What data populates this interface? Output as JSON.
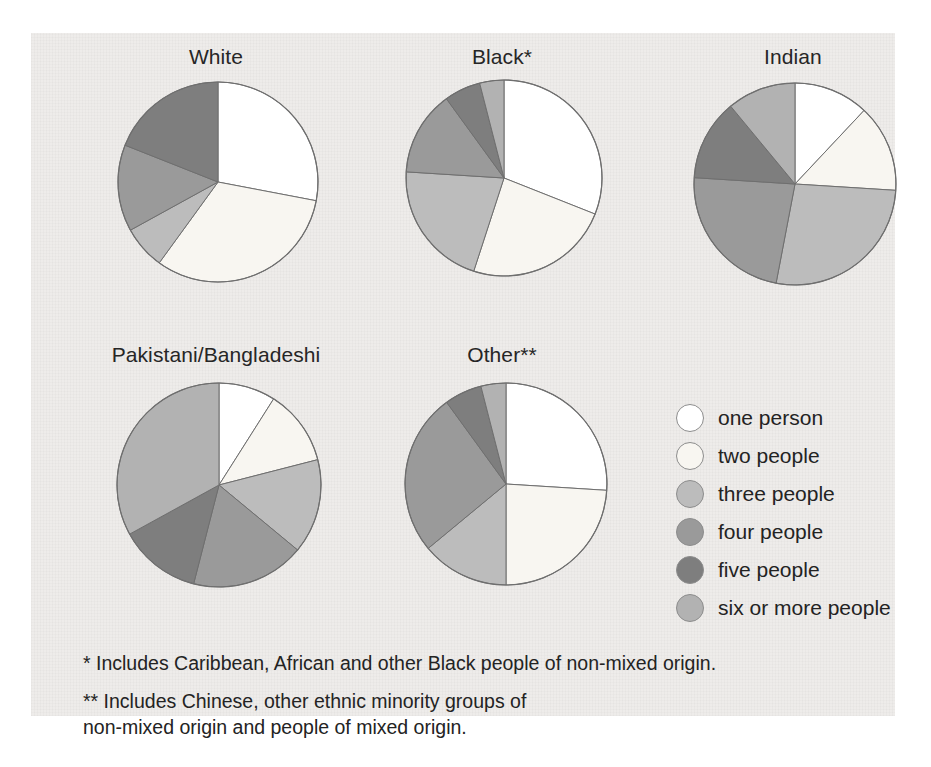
{
  "figure": {
    "background_color": "#ffffff",
    "panel_color": "#eeecea",
    "text_color": "#232323"
  },
  "legend": {
    "items": [
      {
        "label": "one person",
        "color": "#ffffff",
        "key": "one"
      },
      {
        "label": "two people",
        "color": "#f8f6f1",
        "key": "two"
      },
      {
        "label": "three people",
        "color": "#bcbcbc",
        "key": "three"
      },
      {
        "label": "four people",
        "color": "#9a9a9a",
        "key": "four"
      },
      {
        "label": "five people",
        "color": "#7e7e7e",
        "key": "five"
      },
      {
        "label": "six or more people",
        "color": "#b2b2b2",
        "key": "six_plus"
      }
    ]
  },
  "footnotes": [
    "* Includes Caribbean, African and other Black people of non-mixed origin.",
    "** Includes Chinese, other ethnic minority groups of\n     non-mixed origin and people of mixed origin."
  ],
  "chart_data": {
    "type": "pie",
    "title": "",
    "subtitle": "",
    "legend_position": "right-middle",
    "grid": false,
    "slice_labels": [
      "one person",
      "two people",
      "three people",
      "four people",
      "five people",
      "six or more people"
    ],
    "slice_colors": [
      "#ffffff",
      "#f8f6f1",
      "#bcbcbc",
      "#9a9a9a",
      "#7e7e7e",
      "#b2b2b2"
    ],
    "units": "percent of households",
    "charts": [
      {
        "name": "White",
        "title": "White",
        "center_x": 185,
        "center_y": 185,
        "radius": 100,
        "values": [
          28,
          32,
          7,
          14,
          19,
          0
        ],
        "start_angle_deg": 0
      },
      {
        "name": "Black",
        "title": "Black*",
        "center_x": 471,
        "center_y": 181,
        "radius": 98,
        "values": [
          31,
          24,
          21,
          14,
          6,
          4
        ],
        "start_angle_deg": 0
      },
      {
        "name": "Indian",
        "title": "Indian",
        "center_x": 762,
        "center_y": 186,
        "radius": 101,
        "values": [
          12,
          14,
          27,
          23,
          13,
          11
        ],
        "start_angle_deg": 0
      },
      {
        "name": "Pakistani/Bangladeshi",
        "title": "Pakistani/Bangladeshi",
        "center_x": 186,
        "center_y": 484,
        "radius": 102,
        "values": [
          9,
          12,
          15,
          18,
          13,
          33
        ],
        "start_angle_deg": 0
      },
      {
        "name": "Other",
        "title": "Other**",
        "center_x": 472,
        "center_y": 484,
        "radius": 101,
        "values": [
          26,
          24,
          14,
          26,
          6,
          4
        ],
        "start_angle_deg": 0
      }
    ]
  }
}
